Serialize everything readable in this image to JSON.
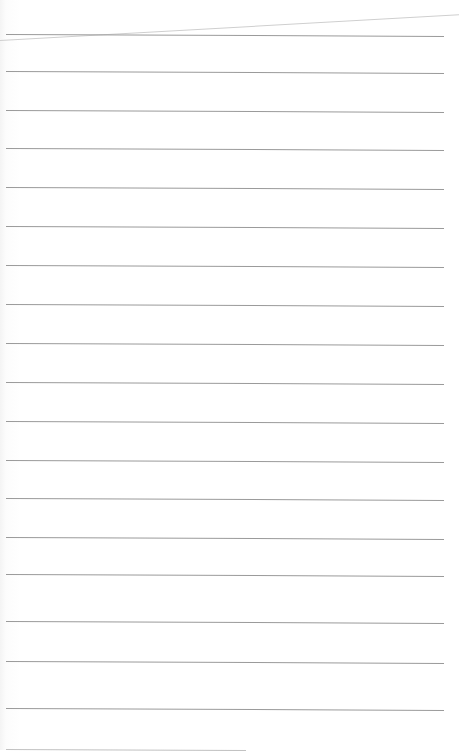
{
  "paper": {
    "type": "ruled-notebook-page",
    "rule_color": "#9a9a9a",
    "background": "#ffffff",
    "rules_y": [
      34,
      71,
      110,
      148,
      187,
      226,
      265,
      304,
      343,
      382,
      421,
      460,
      498,
      537,
      574,
      621,
      661,
      708,
      749
    ]
  }
}
